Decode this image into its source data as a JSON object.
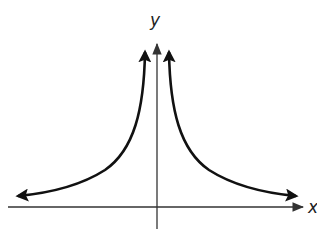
{
  "diagram": {
    "type": "graph",
    "axes": {
      "x_label": "x",
      "y_label": "y"
    },
    "colors": {
      "curve": "#111111",
      "axis": "#333333",
      "background": "#ffffff"
    }
  }
}
